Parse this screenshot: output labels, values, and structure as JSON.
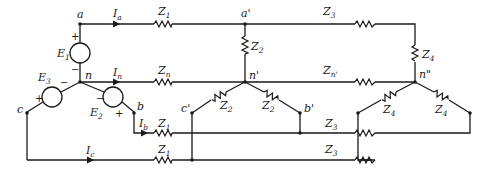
{
  "diagram": {
    "type": "three-phase-circuit",
    "nodes": {
      "a": "a",
      "n": "n",
      "b": "b",
      "c": "c",
      "a_prime": "a'",
      "n_prime": "n'",
      "b_prime": "b'",
      "c_prime": "c'",
      "n_double_prime": "n\""
    },
    "sources": [
      {
        "name": "E",
        "sub": "1",
        "plus": "+",
        "minus": "−"
      },
      {
        "name": "E",
        "sub": "2",
        "plus": "+",
        "minus": "−"
      },
      {
        "name": "E",
        "sub": "3",
        "plus": "+",
        "minus": "−"
      }
    ],
    "currents": {
      "Ia": {
        "name": "I",
        "sub": "a"
      },
      "In": {
        "name": "I",
        "sub": "n"
      },
      "Ib": {
        "name": "I",
        "sub": "b"
      },
      "Ic": {
        "name": "I",
        "sub": "c"
      }
    },
    "impedances": {
      "line_a": {
        "name": "Z",
        "sub": "1"
      },
      "line_n": {
        "name": "Z",
        "sub": "n"
      },
      "line_b": {
        "name": "Z",
        "sub": "1"
      },
      "line_c": {
        "name": "Z",
        "sub": "1"
      },
      "load1_a": {
        "name": "Z",
        "sub": "2"
      },
      "load1_c": {
        "name": "Z",
        "sub": "2"
      },
      "load1_b": {
        "name": "Z",
        "sub": "2"
      },
      "line2_a": {
        "name": "Z",
        "sub": "3"
      },
      "line2_n": {
        "name": "Z",
        "sub": "n'"
      },
      "line2_b": {
        "name": "Z",
        "sub": "3"
      },
      "line2_c": {
        "name": "Z",
        "sub": "3"
      },
      "load2_a": {
        "name": "Z",
        "sub": "4"
      },
      "load2_c": {
        "name": "Z",
        "sub": "4"
      },
      "load2_b": {
        "name": "Z",
        "sub": "4"
      }
    }
  }
}
